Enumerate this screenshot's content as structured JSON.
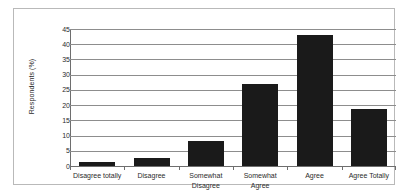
{
  "chart_data": {
    "type": "bar",
    "title": "",
    "xlabel": "",
    "ylabel": "Respondents (%)",
    "categories": [
      "Disagree totally",
      "Disagree",
      "Somewhat Disagree",
      "Somewhat Agree",
      "Agree",
      "Agree Totally"
    ],
    "category_lines": [
      [
        "Disagree totally"
      ],
      [
        "Disagree"
      ],
      [
        "Somewhat",
        "Disagree"
      ],
      [
        "Somewhat",
        "Agree"
      ],
      [
        "Agree"
      ],
      [
        "Agree Totally"
      ]
    ],
    "values": [
      1.2,
      2.7,
      8.1,
      26.8,
      43.0,
      18.8
    ],
    "ylim": [
      0,
      45
    ],
    "ytick_values": [
      0,
      5,
      10,
      15,
      20,
      25,
      30,
      35,
      40,
      45
    ],
    "ytick_labels": [
      "0",
      "5",
      "10",
      "15",
      "20",
      "25",
      "30",
      "35",
      "40",
      "45"
    ],
    "grid": true,
    "legend": false,
    "bar_color": "#1a1a1a",
    "gridline_color": "#8d8d8d",
    "axis_color": "#6e6e6e",
    "background_color": "#ffffff",
    "frame_color": "#b9b9b9"
  }
}
